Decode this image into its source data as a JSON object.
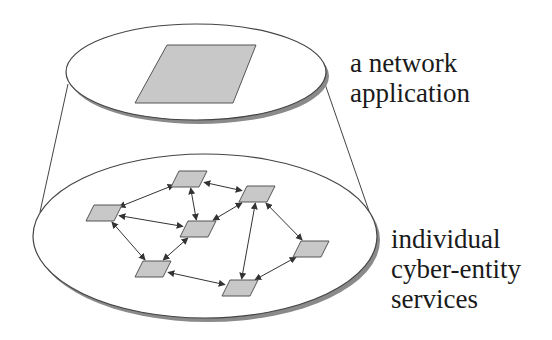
{
  "figure": {
    "top_layer": {
      "label_lines": [
        "a network",
        "application"
      ],
      "ellipse": {
        "cx": 196,
        "cy": 72,
        "rx": 130,
        "ry": 48
      },
      "node": {
        "points": [
          [
            167,
            45
          ],
          [
            256,
            45
          ],
          [
            233,
            103
          ],
          [
            135,
            103
          ]
        ]
      }
    },
    "bottom_layer": {
      "label_lines": [
        "individual",
        "cyber-entity",
        "services"
      ],
      "ellipse": {
        "cx": 205,
        "cy": 236,
        "rx": 172,
        "ry": 82
      },
      "nodes": [
        {
          "id": "n1",
          "cx": 189,
          "cy": 179
        },
        {
          "id": "n2",
          "cx": 257,
          "cy": 194
        },
        {
          "id": "n3",
          "cx": 104,
          "cy": 213
        },
        {
          "id": "n4",
          "cx": 198,
          "cy": 229
        },
        {
          "id": "n5",
          "cx": 153,
          "cy": 269
        },
        {
          "id": "n6",
          "cx": 240,
          "cy": 288
        },
        {
          "id": "n7",
          "cx": 311,
          "cy": 249
        }
      ],
      "edges": [
        [
          "n1",
          "n3"
        ],
        [
          "n1",
          "n2"
        ],
        [
          "n1",
          "n4"
        ],
        [
          "n3",
          "n4"
        ],
        [
          "n3",
          "n5"
        ],
        [
          "n4",
          "n2"
        ],
        [
          "n5",
          "n4"
        ],
        [
          "n5",
          "n6"
        ],
        [
          "n2",
          "n6"
        ],
        [
          "n2",
          "n7"
        ],
        [
          "n7",
          "n6"
        ]
      ]
    },
    "cone_lines": [
      {
        "x1": 68,
        "y1": 84,
        "x2": 40,
        "y2": 212
      },
      {
        "x1": 325,
        "y1": 84,
        "x2": 370,
        "y2": 214
      }
    ],
    "colors": {
      "node_fill": "#c8c8c8",
      "node_stroke": "#555555",
      "line": "#444444",
      "shadow": "#8a8a8a"
    }
  }
}
